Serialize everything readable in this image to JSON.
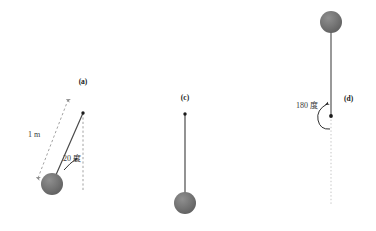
{
  "figure": {
    "title_present": false,
    "background_color": "#ffffff",
    "panels": [
      {
        "id": "a",
        "label": "(a)",
        "label_x": 83,
        "label_y": 84,
        "pivot": {
          "x": 83,
          "y": 113
        },
        "bob": {
          "x": 52,
          "y": 184,
          "radius": 11
        },
        "rod_color": "#4a4a4a",
        "bob_color": "#6b6b6b",
        "reference_line": {
          "type": "dashed-vertical",
          "x": 83,
          "y_top": 113,
          "y_bottom": 192,
          "color": "#8a8a8a"
        },
        "angle_annotation": {
          "value": "20",
          "unit": "度",
          "text": "20 度",
          "label_x": 63,
          "label_y": 161,
          "arc_color": "#1a1a1a"
        },
        "length_annotation": {
          "text": "1 m",
          "label_x": 28,
          "label_y": 137,
          "arrow_style": "double-headed-dashed",
          "arrow_color": "#8a8a8a",
          "from": {
            "x": 38,
            "y": 178
          },
          "to": {
            "x": 68,
            "y": 100
          }
        }
      },
      {
        "id": "c",
        "label": "(c)",
        "label_x": 185,
        "label_y": 100,
        "pivot": {
          "x": 185,
          "y": 114
        },
        "bob": {
          "x": 185,
          "y": 203,
          "radius": 11
        },
        "rod_color": "#4a4a4a",
        "bob_color": "#6b6b6b",
        "reference_line": null,
        "angle_annotation": null,
        "length_annotation": null
      },
      {
        "id": "d",
        "label": "(d)",
        "label_x": 344,
        "label_y": 101,
        "pivot": {
          "x": 331,
          "y": 116
        },
        "bob": {
          "x": 331,
          "y": 22,
          "radius": 11
        },
        "rod_color": "#6e6e6e",
        "bob_color": "#6b6b6b",
        "reference_line": {
          "type": "dotted-vertical",
          "x": 331,
          "y_top": 116,
          "y_bottom": 205,
          "color": "#b6b6b6"
        },
        "angle_annotation": {
          "value": "180",
          "unit": "度",
          "text": "180 度",
          "label_x": 296,
          "label_y": 108,
          "arc_color": "#1a1a1a"
        },
        "length_annotation": null
      }
    ],
    "colors": {
      "bob_fill": "#6b6b6b",
      "bob_highlight": "#8f8f8f",
      "rod": "#4a4a4a",
      "dashed_guide": "#8a8a8a",
      "dotted_guide": "#b6b6b6",
      "text": "#1a1a1a",
      "background": "#ffffff"
    }
  }
}
